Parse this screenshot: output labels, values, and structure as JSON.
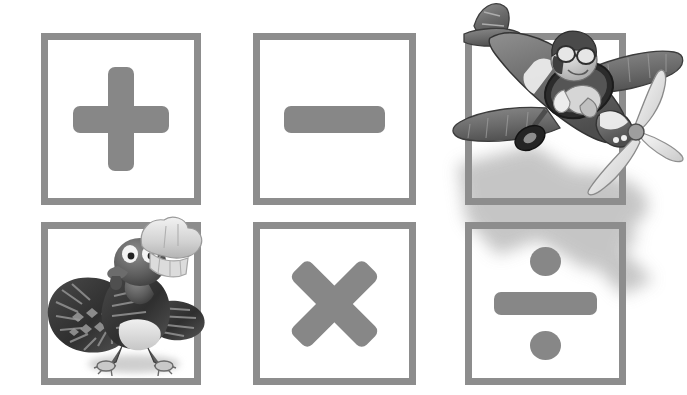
{
  "canvas": {
    "width": 687,
    "height": 395,
    "background": "#ffffff",
    "description": "Three-by-two grid of gray square frames holding arithmetic operator symbols, with two grayscale cartoon illustrations overlaid"
  },
  "palette": {
    "frame_gray": "#8d8d8d",
    "symbol_gray": "#878787",
    "shadow_gray": "#c9c9c9",
    "ink_dark": "#3a3a3a",
    "ink_mid": "#6f6f6f",
    "ink_light": "#d9d9d9",
    "paper_white": "#ffffff"
  },
  "grid": {
    "rows": 2,
    "columns": 3,
    "cells": [
      {
        "id": "cell-plus",
        "name": "plus-operator-cell",
        "symbol": "+",
        "symbol_name": "plus-sign",
        "operation": "addition",
        "row": 1,
        "column": 1,
        "x": 41,
        "y": 33,
        "width": 160,
        "height": 172,
        "occluded_by": ""
      },
      {
        "id": "cell-minus",
        "name": "minus-operator-cell",
        "symbol": "−",
        "symbol_name": "minus-sign",
        "operation": "subtraction",
        "row": 1,
        "column": 2,
        "x": 253,
        "y": 33,
        "width": 163,
        "height": 172,
        "occluded_by": ""
      },
      {
        "id": "cell-airplane",
        "name": "airplane-illustration-cell",
        "symbol": "",
        "symbol_name": "",
        "operation": "",
        "row": 1,
        "column": 3,
        "x": 465,
        "y": 33,
        "width": 161,
        "height": 172,
        "occluded_by": "airplane"
      },
      {
        "id": "cell-turkey",
        "name": "turkey-illustration-cell",
        "symbol": "",
        "symbol_name": "",
        "operation": "",
        "row": 2,
        "column": 1,
        "x": 41,
        "y": 222,
        "width": 160,
        "height": 163,
        "occluded_by": "turkey"
      },
      {
        "id": "cell-times",
        "name": "multiply-operator-cell",
        "symbol": "×",
        "symbol_name": "multiplication-sign",
        "operation": "multiplication",
        "row": 2,
        "column": 2,
        "x": 253,
        "y": 222,
        "width": 163,
        "height": 163,
        "occluded_by": ""
      },
      {
        "id": "cell-divide",
        "name": "divide-operator-cell",
        "symbol": "÷",
        "symbol_name": "division-sign",
        "operation": "division",
        "row": 2,
        "column": 3,
        "x": 465,
        "y": 222,
        "width": 161,
        "height": 163,
        "occluded_by": "airplane-shadow"
      }
    ]
  },
  "illustrations": [
    {
      "id": "airplane",
      "name": "airplane-with-pilot-illustration",
      "subject": "Cartoon propeller airplane flown by a goggled pilot",
      "style": "grayscale halftone cartoon",
      "x": 440,
      "y": 0,
      "width": 247,
      "height": 205,
      "has_drop_shadow": true,
      "parts": [
        "fuselage",
        "cockpit-canopy",
        "pilot-head",
        "flight-goggles",
        "leather-helmet",
        "scarf",
        "upper-wing",
        "lower-wing",
        "tail-fin",
        "horizontal-stabilizer",
        "landing-gear-wheel",
        "engine-cowling",
        "propeller-blades",
        "propeller-hub",
        "nose-stripe-band"
      ]
    },
    {
      "id": "turkey",
      "name": "turkey-chef-illustration",
      "subject": "Cartoon turkey wearing a chef's toque",
      "style": "grayscale halftone cartoon",
      "x": 38,
      "y": 215,
      "width": 170,
      "height": 170,
      "has_drop_shadow": true,
      "parts": [
        "chef-hat",
        "head",
        "eyes",
        "beak",
        "wattle",
        "feathered-body",
        "tail-feathers",
        "wing",
        "belly",
        "legs",
        "feet"
      ]
    }
  ]
}
